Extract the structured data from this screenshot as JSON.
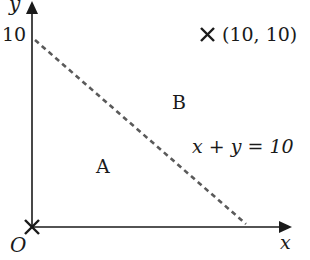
{
  "diagram": {
    "axes": {
      "x_label": "x",
      "y_label": "y",
      "origin_label": "O",
      "y_tick_label": "10"
    },
    "line": {
      "equation_label": "x + y = 10",
      "style": "dashed",
      "color": "#5a5a5a"
    },
    "regions": {
      "below_label": "A",
      "above_label": "B"
    },
    "points": [
      {
        "marker": "cross",
        "label": "(10, 10)",
        "x": 10,
        "y": 10
      },
      {
        "marker": "cross",
        "label": "",
        "x": 0,
        "y": 0
      }
    ],
    "colors": {
      "axis": "#1a1a1a",
      "text": "#1a1a1a",
      "dash": "#5a5a5a",
      "background": "#ffffff"
    }
  }
}
